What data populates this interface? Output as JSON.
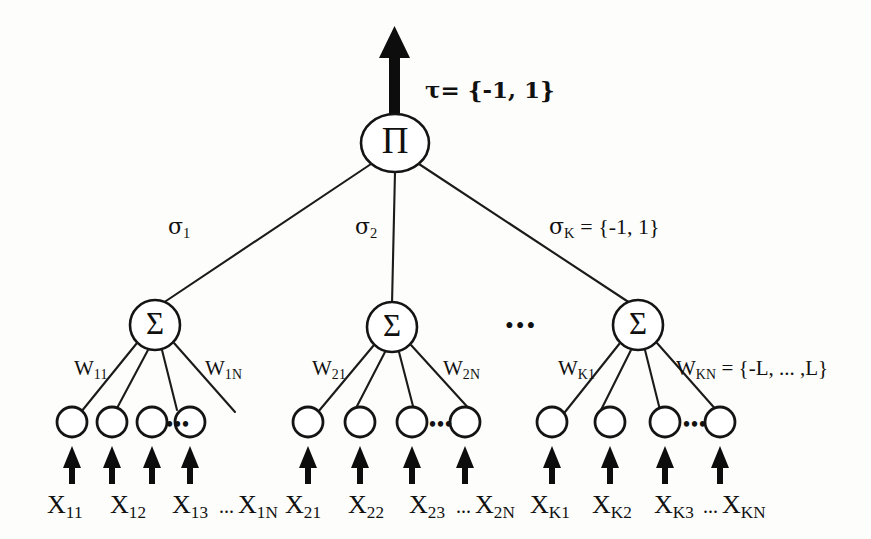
{
  "diagram": {
    "output": {
      "arrow_name": "output-arrow",
      "label": "τ= {-1, 1}"
    },
    "output_node": {
      "glyph": "Π",
      "name": "product-node"
    },
    "hidden_nodes": [
      {
        "glyph": "Σ",
        "name": "sum-node-1"
      },
      {
        "glyph": "Σ",
        "name": "sum-node-2"
      },
      {
        "glyph": "Σ",
        "name": "sum-node-k"
      }
    ],
    "sigma_labels": [
      {
        "text": "σ",
        "sub": "1"
      },
      {
        "text": "σ",
        "sub": "2"
      },
      {
        "text": "σ",
        "sub": "K",
        "suffix": " = {-1, 1}"
      }
    ],
    "weight_labels": [
      {
        "text": "W",
        "sub": "11"
      },
      {
        "text": "W",
        "sub": "1N"
      },
      {
        "text": "W",
        "sub": "21"
      },
      {
        "text": "W",
        "sub": "2N"
      },
      {
        "text": "W",
        "sub": "K1"
      },
      {
        "text": "W",
        "sub": "KN",
        "suffix": " = {-L, ... ,L}"
      }
    ],
    "input_labels": [
      {
        "text": "X",
        "sub": "11"
      },
      {
        "text": "X",
        "sub": "12"
      },
      {
        "text": "X",
        "sub": "13"
      },
      {
        "text": "X",
        "sub": "1N"
      },
      {
        "text": "X",
        "sub": "21"
      },
      {
        "text": "X",
        "sub": "22"
      },
      {
        "text": "X",
        "sub": "23"
      },
      {
        "text": "X",
        "sub": "2N"
      },
      {
        "text": "X",
        "sub": "K1"
      },
      {
        "text": "X",
        "sub": "K2"
      },
      {
        "text": "X",
        "sub": "K3"
      },
      {
        "text": "X",
        "sub": "KN"
      }
    ],
    "ellipses": {
      "between_sums": "•••",
      "between_inputs": "•••",
      "in_label_row": "..."
    },
    "colors": {
      "stroke": "#141414",
      "fill": "#ffffff",
      "background": "#fdfdfb",
      "text": "#111111"
    }
  }
}
